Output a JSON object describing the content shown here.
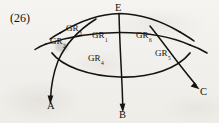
{
  "figure": {
    "index_label": "(26)",
    "caption": "",
    "background_color": "#f2f0ec",
    "ink_color": "#151311"
  },
  "nodes": [
    {
      "id": "E",
      "label": "E",
      "role": "apex-vertex",
      "x": 120,
      "y": 10
    },
    {
      "id": "A",
      "label": "A",
      "role": "arrow-endpoint",
      "x": 51,
      "y": 108
    },
    {
      "id": "B",
      "label": "B",
      "role": "arrow-endpoint",
      "x": 122,
      "y": 116
    },
    {
      "id": "C",
      "label": "C",
      "role": "arrow-endpoint",
      "x": 203,
      "y": 93
    }
  ],
  "region_labels": [
    {
      "id": "gr-upper-left-outer",
      "base": "GR",
      "sub": "3",
      "x": 66,
      "y": 28
    },
    {
      "id": "gr-far-left",
      "base": "GR",
      "sub": "2",
      "x": 50,
      "y": 41
    },
    {
      "id": "gr-upper-mid",
      "base": "GR",
      "sub": "1",
      "x": 92,
      "y": 35
    },
    {
      "id": "gr-upper-right",
      "base": "GR",
      "sub": "6",
      "x": 136,
      "y": 35
    },
    {
      "id": "gr-lower-mid",
      "base": "GR",
      "sub": "4",
      "x": 88,
      "y": 58
    },
    {
      "id": "gr-lower-right",
      "base": "GR",
      "sub": "5",
      "x": 155,
      "y": 53
    }
  ],
  "curves": [
    {
      "id": "arc-upper",
      "description": "upper arc sweeping from left edge up through E and down to right edge"
    },
    {
      "id": "arc-middle",
      "description": "middle arc running left to right beneath the upper arc"
    },
    {
      "id": "arc-lower",
      "description": "lower arc forming the bottom boundary of the mesh"
    },
    {
      "id": "ray-to-A",
      "description": "curve descending from upper right through mesh, arrow terminating at A"
    },
    {
      "id": "ray-to-B",
      "description": "curve descending from E through mesh, arrow terminating at B"
    },
    {
      "id": "ray-to-C",
      "description": "curve descending from upper area through mesh, arrow terminating at C"
    }
  ]
}
